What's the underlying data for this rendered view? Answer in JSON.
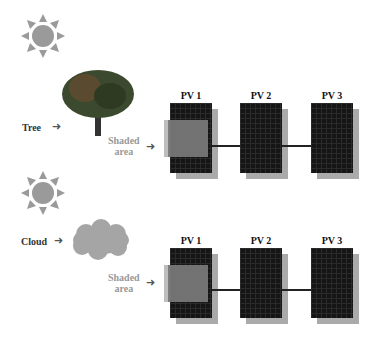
{
  "scenarios": [
    {
      "sun_icon": "sun-icon",
      "obstacle": {
        "label": "Tree",
        "icon": "tree-icon"
      },
      "shaded_label": [
        "Shaded",
        "area"
      ],
      "panels": [
        "PV 1",
        "PV 2",
        "PV 3"
      ]
    },
    {
      "sun_icon": "sun-icon",
      "obstacle": {
        "label": "Cloud",
        "icon": "cloud-icon"
      },
      "shaded_label": [
        "Shaded",
        "area"
      ],
      "panels": [
        "PV 1",
        "PV 2",
        "PV 3"
      ]
    }
  ],
  "colors": {
    "panel": "#151515",
    "shade": "#777777",
    "sun": "#9a9a9a",
    "text_muted": "#999999"
  }
}
